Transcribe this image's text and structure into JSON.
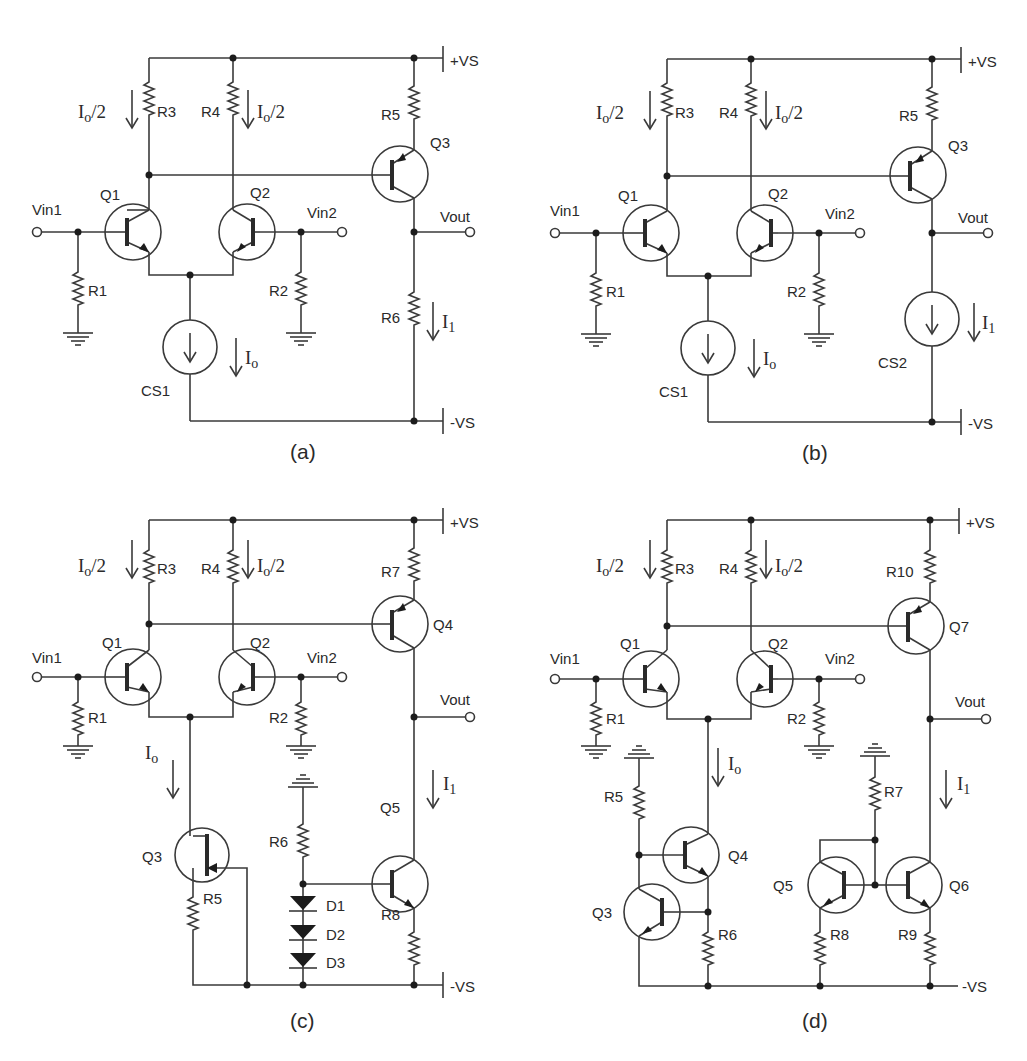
{
  "figure": {
    "panels": [
      {
        "id": "a",
        "caption": "(a)",
        "supplies": {
          "positive": "+VS",
          "negative": "-VS"
        },
        "inputs": [
          "Vin1",
          "Vin2"
        ],
        "output": "Vout",
        "components": [
          "Q1",
          "Q2",
          "Q3",
          "R1",
          "R2",
          "R3",
          "R4",
          "R5",
          "R6",
          "CS1"
        ],
        "currents": [
          "Io/2",
          "Io/2",
          "Io",
          "I1"
        ]
      },
      {
        "id": "b",
        "caption": "(b)",
        "supplies": {
          "positive": "+VS",
          "negative": "-VS"
        },
        "inputs": [
          "Vin1",
          "Vin2"
        ],
        "output": "Vout",
        "components": [
          "Q1",
          "Q2",
          "Q3",
          "R1",
          "R2",
          "R3",
          "R4",
          "R5",
          "CS1",
          "CS2"
        ],
        "currents": [
          "Io/2",
          "Io/2",
          "Io",
          "I1"
        ]
      },
      {
        "id": "c",
        "caption": "(c)",
        "supplies": {
          "positive": "+VS",
          "negative": "-VS"
        },
        "inputs": [
          "Vin1",
          "Vin2"
        ],
        "output": "Vout",
        "components": [
          "Q1",
          "Q2",
          "Q3",
          "Q4",
          "Q5",
          "R1",
          "R2",
          "R3",
          "R4",
          "R5",
          "R6",
          "R7",
          "R8",
          "D1",
          "D2",
          "D3"
        ],
        "currents": [
          "Io/2",
          "Io/2",
          "Io",
          "I1"
        ]
      },
      {
        "id": "d",
        "caption": "(d)",
        "supplies": {
          "positive": "+VS",
          "negative": "-VS"
        },
        "inputs": [
          "Vin1",
          "Vin2"
        ],
        "output": "Vout",
        "components": [
          "Q1",
          "Q2",
          "Q3",
          "Q4",
          "Q5",
          "Q6",
          "Q7",
          "R1",
          "R2",
          "R3",
          "R4",
          "R5",
          "R6",
          "R7",
          "R8",
          "R9",
          "R10"
        ],
        "currents": [
          "Io/2",
          "Io/2",
          "Io",
          "I1"
        ]
      }
    ]
  },
  "labels": {
    "vs_pos": "+VS",
    "vs_neg": "-VS",
    "vin1": "Vin1",
    "vin2": "Vin2",
    "vout": "Vout",
    "cur_main": "I",
    "cur_sub_o": "o",
    "cur_sub_1": "1",
    "cur_half": "/2",
    "a": {
      "caption": "(a)",
      "Q1": "Q1",
      "Q2": "Q2",
      "Q3": "Q3",
      "R1": "R1",
      "R2": "R2",
      "R3": "R3",
      "R4": "R4",
      "R5": "R5",
      "R6": "R6",
      "CS1": "CS1"
    },
    "b": {
      "caption": "(b)",
      "Q1": "Q1",
      "Q2": "Q2",
      "Q3": "Q3",
      "R1": "R1",
      "R2": "R2",
      "R3": "R3",
      "R4": "R4",
      "R5": "R5",
      "CS1": "CS1",
      "CS2": "CS2"
    },
    "c": {
      "caption": "(c)",
      "Q1": "Q1",
      "Q2": "Q2",
      "Q3": "Q3",
      "Q4": "Q4",
      "Q5": "Q5",
      "R1": "R1",
      "R2": "R2",
      "R3": "R3",
      "R4": "R4",
      "R5": "R5",
      "R6": "R6",
      "R7": "R7",
      "R8": "R8",
      "D1": "D1",
      "D2": "D2",
      "D3": "D3"
    },
    "d": {
      "caption": "(d)",
      "Q1": "Q1",
      "Q2": "Q2",
      "Q3": "Q3",
      "Q4": "Q4",
      "Q5": "Q5",
      "Q6": "Q6",
      "Q7": "Q7",
      "R1": "R1",
      "R2": "R2",
      "R3": "R3",
      "R4": "R4",
      "R5": "R5",
      "R6": "R6",
      "R7": "R7",
      "R8": "R8",
      "R9": "R9",
      "R10": "R10"
    }
  },
  "colors": {
    "ink": "#2a2a2a",
    "background": "#ffffff"
  }
}
